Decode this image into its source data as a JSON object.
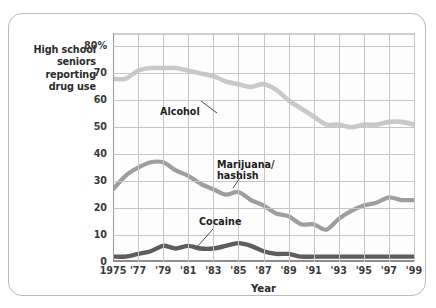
{
  "axis": {
    "y_caption": "High school seniors reporting drug use",
    "y_caption_lines": [
      "High school",
      "seniors",
      "reporting",
      "drug use"
    ],
    "x_title": "Year",
    "y_ticks": [
      "80%",
      "70",
      "60",
      "50",
      "40",
      "30",
      "20",
      "10",
      "0"
    ],
    "x_ticks": [
      "1975",
      "'77",
      "'79",
      "'81",
      "'83",
      "'85",
      "'87",
      "'89",
      "'91",
      "'93",
      "'95",
      "'97",
      "'99"
    ]
  },
  "annotations": {
    "alcohol": "Alcohol",
    "marijuana_line1": "Marijuana/",
    "marijuana_line2": "hashish",
    "cocaine": "Cocaine"
  },
  "colors": {
    "alcohol": "#c9c9c9",
    "marijuana": "#9e9e9e",
    "cocaine": "#5d5d5d",
    "grid": "#c6c6c6",
    "axis": "#8d8d8d",
    "card_border": "#b9b9b9",
    "text": "#2b2b2b"
  },
  "chart_data": {
    "type": "line",
    "title": "",
    "xlabel": "Year",
    "ylabel": "High school seniors reporting drug use",
    "xlim": [
      1975,
      1999
    ],
    "ylim": [
      0,
      85
    ],
    "grid": true,
    "legend": "inline-annotations",
    "x": [
      1975,
      1976,
      1977,
      1978,
      1979,
      1980,
      1981,
      1982,
      1983,
      1984,
      1985,
      1986,
      1987,
      1988,
      1989,
      1990,
      1991,
      1992,
      1993,
      1994,
      1995,
      1996,
      1997,
      1998,
      1999
    ],
    "series": [
      {
        "name": "Alcohol",
        "color": "#c9c9c9",
        "values": [
          68,
          68,
          71,
          72,
          72,
          72,
          71,
          70,
          69,
          67,
          66,
          65,
          66,
          64,
          60,
          57,
          54,
          51,
          51,
          50,
          51,
          51,
          52,
          52,
          51
        ]
      },
      {
        "name": "Marijuana/hashish",
        "color": "#9e9e9e",
        "values": [
          27,
          32,
          35,
          37,
          37,
          34,
          32,
          29,
          27,
          25,
          26,
          23,
          21,
          18,
          17,
          14,
          14,
          12,
          16,
          19,
          21,
          22,
          24,
          23,
          23
        ]
      },
      {
        "name": "Cocaine",
        "color": "#5d5d5d",
        "values": [
          2,
          2,
          3,
          4,
          6,
          5,
          6,
          5,
          5,
          6,
          7,
          6,
          4,
          3,
          3,
          2,
          2,
          2,
          2,
          2,
          2,
          2,
          2,
          2,
          2
        ]
      }
    ]
  }
}
